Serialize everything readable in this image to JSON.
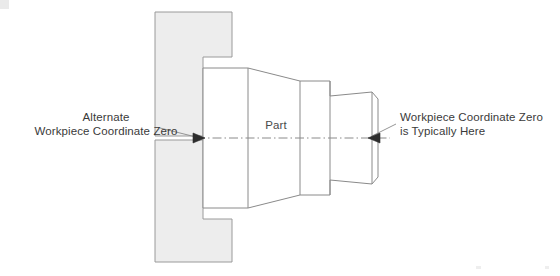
{
  "diagram": {
    "background_color": "#ffffff",
    "line_color": "#8a8a8a",
    "fill_color": "#ededed",
    "text_color": "#3a3a3a"
  },
  "labels": {
    "alternate_zero": {
      "line1": "Alternate",
      "line2": "Workpiece Coordinate Zero"
    },
    "typical_zero": {
      "line1": "Workpiece Coordinate Zero",
      "line2": "is Typically Here"
    },
    "part": "Part"
  },
  "elements": {
    "chuck_jaw_upper": "chuck-jaw-upper",
    "chuck_jaw_lower": "chuck-jaw-lower",
    "part_body": "part-body",
    "centerline": "centerline",
    "arrow_left": "left-arrowhead",
    "arrow_right": "right-arrowhead",
    "leader_left": "left-leader-line",
    "leader_right": "right-leader-line"
  }
}
